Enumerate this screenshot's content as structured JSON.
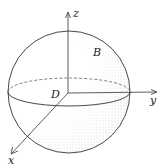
{
  "figure": {
    "type": "sphere-with-3d-axes",
    "labels": {
      "z_axis": "z",
      "y_axis": "y",
      "x_axis": "x",
      "solid": "B",
      "region": "D"
    },
    "colors": {
      "stroke": "#333333",
      "shading": "#555555",
      "background": "#ffffff"
    }
  }
}
